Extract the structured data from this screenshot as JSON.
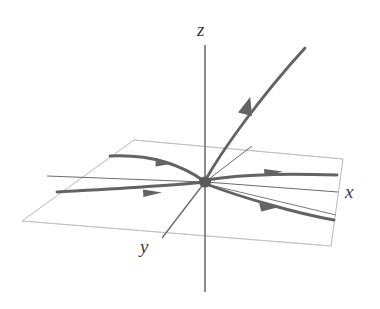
{
  "figure": {
    "background_color": "#ffffff",
    "width": 380,
    "height": 309
  },
  "axes": {
    "z": {
      "label": "z",
      "color": "#555555"
    },
    "x": {
      "label": "x",
      "color": "#555555"
    },
    "y": {
      "label": "y",
      "color": "#555555"
    }
  },
  "origin": {
    "name": "equilibrium-point",
    "color": "#5a5a5a"
  },
  "plane": {
    "name": "xy-plane",
    "stroke_color": "#b9b9b9",
    "grid_color": "#8a8a8a"
  },
  "trajectories": {
    "stroke_color": "#636363",
    "items": [
      {
        "name": "upper-left-inflow",
        "direction": "toward-origin",
        "arrow": "right"
      },
      {
        "name": "lower-left-inflow",
        "direction": "toward-origin",
        "arrow": "right"
      },
      {
        "name": "upper-right-inflow",
        "direction": "toward-origin",
        "arrow": "left"
      },
      {
        "name": "lower-right-inflow",
        "direction": "toward-origin",
        "arrow": "left"
      },
      {
        "name": "z-axis-outflow",
        "direction": "toward-origin",
        "arrow": "down-left"
      }
    ]
  }
}
